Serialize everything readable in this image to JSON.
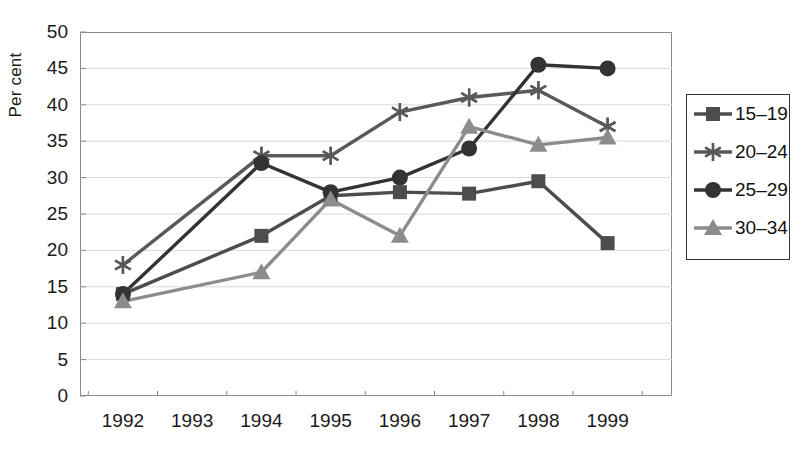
{
  "chart_data": {
    "type": "line",
    "title": "",
    "xlabel": "",
    "ylabel": "Per cent",
    "x": [
      "1992",
      "1993",
      "1994",
      "1995",
      "1996",
      "1997",
      "1998",
      "1999"
    ],
    "xtick_labels": [
      "1992",
      "1993",
      "1994",
      "1995",
      "1996",
      "1997",
      "1998",
      "1999"
    ],
    "ytick_labels": [
      "0",
      "5",
      "10",
      "15",
      "20",
      "25",
      "30",
      "35",
      "40",
      "45",
      "50"
    ],
    "ylim": [
      0,
      50
    ],
    "ytick_step": 5,
    "grid": "horizontal",
    "legend_position": "right",
    "series": [
      {
        "name": "15–19",
        "marker": "square",
        "color": "#4d4d4d",
        "values": [
          14,
          null,
          22,
          27.5,
          28,
          27.8,
          29.5,
          21
        ]
      },
      {
        "name": "20–24",
        "marker": "asterisk",
        "color": "#595959",
        "values": [
          18,
          null,
          33,
          33,
          39,
          41,
          42,
          37
        ]
      },
      {
        "name": "25–29",
        "marker": "circle",
        "color": "#333333",
        "values": [
          14,
          null,
          32,
          28,
          30,
          34,
          45.5,
          45
        ]
      },
      {
        "name": "30–34",
        "marker": "triangle",
        "color": "#8c8c8c",
        "values": [
          13,
          null,
          17,
          27,
          22,
          37,
          34.5,
          35.5
        ]
      }
    ]
  },
  "legend": {
    "entries": [
      {
        "label": "15–19",
        "marker": "square"
      },
      {
        "label": "20–24",
        "marker": "asterisk"
      },
      {
        "label": "25–29",
        "marker": "circle"
      },
      {
        "label": "30–34",
        "marker": "triangle"
      }
    ]
  }
}
